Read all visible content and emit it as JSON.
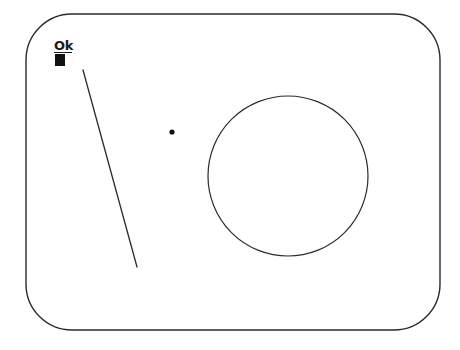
{
  "canvas": {
    "width": 460,
    "height": 350,
    "background_color": "#ffffff",
    "stroke_color": "#2b2b2b",
    "ink_color": "#111111"
  },
  "frame": {
    "shape_name": "rounded-rectangle",
    "x": 26,
    "y": 14,
    "width": 414,
    "height": 316,
    "corner_radius": 46,
    "stroke_width": 1.4,
    "stroke_color": "#2b2b2b",
    "fill": "none"
  },
  "label": {
    "text": "Ok",
    "underlined": true,
    "bold": true,
    "x": 54,
    "y": 39,
    "color": "#1a1a1a"
  },
  "marker_square": {
    "shape_name": "filled-square",
    "x": 55,
    "y": 54,
    "width": 10,
    "height": 12,
    "fill": "#111111"
  },
  "diagonal_line": {
    "shape_name": "diagonal-line",
    "x1": 83,
    "y1": 70,
    "x2": 137,
    "y2": 267,
    "stroke_width": 1.3,
    "stroke_color": "#2b2b2b"
  },
  "dot": {
    "shape_name": "dot",
    "cx": 172,
    "cy": 132,
    "radius": 2.6,
    "fill": "#111111"
  },
  "circle": {
    "shape_name": "circle",
    "cx": 288,
    "cy": 176,
    "radius": 80,
    "stroke_width": 1.2,
    "stroke_color": "#2b2b2b",
    "fill": "none"
  }
}
